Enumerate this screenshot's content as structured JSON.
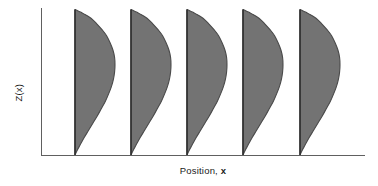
{
  "figure": {
    "title": "",
    "background_color": "#ffffff"
  },
  "axes": {
    "y_label": "Z(x)",
    "x_label_prefix": "Position, ",
    "x_label_variable": "x",
    "x_label_full": "Position, x",
    "axis_color": "#606060",
    "show_ticks": false,
    "show_tick_labels": false,
    "show_grid": false
  },
  "chart_data": {
    "type": "area",
    "title": "",
    "xlabel": "Position, x",
    "ylabel": "Z(x)",
    "orientation": "horizontal-amplitude",
    "legend": "none",
    "grid": false,
    "xlim": [
      0,
      1
    ],
    "ylim": [
      0,
      1
    ],
    "series_count": 5,
    "baseline_positions_px": [
      75,
      131,
      187,
      243,
      300
    ],
    "baseline_positions_normalized": [
      0.105,
      0.278,
      0.451,
      0.623,
      0.799
    ],
    "peak_amplitude_px": 40,
    "peak_height_normalized": 0.52,
    "curve_profile": {
      "comment": "Amplitude of each distribution sampled from the top of the axis (Z high) down to the baseline (Z low).",
      "z_fraction": [
        1.0,
        0.97,
        0.94,
        0.9,
        0.86,
        0.82,
        0.77,
        0.72,
        0.67,
        0.62,
        0.57,
        0.52,
        0.47,
        0.42,
        0.37,
        0.32,
        0.27,
        0.22,
        0.17,
        0.12,
        0.07,
        0.03,
        0.0
      ],
      "amplitude_fraction": [
        0.0,
        0.22,
        0.4,
        0.55,
        0.68,
        0.79,
        0.88,
        0.95,
        0.99,
        1.0,
        0.99,
        0.96,
        0.91,
        0.84,
        0.76,
        0.66,
        0.56,
        0.45,
        0.34,
        0.23,
        0.13,
        0.05,
        0.0
      ]
    },
    "series": [
      {
        "name": "distribution-1",
        "baseline_x": 0.105,
        "peak_amplitude": 0.52,
        "peak_z": 0.62
      },
      {
        "name": "distribution-2",
        "baseline_x": 0.278,
        "peak_amplitude": 0.52,
        "peak_z": 0.62
      },
      {
        "name": "distribution-3",
        "baseline_x": 0.451,
        "peak_amplitude": 0.52,
        "peak_z": 0.62
      },
      {
        "name": "distribution-4",
        "baseline_x": 0.623,
        "peak_amplitude": 0.52,
        "peak_z": 0.62
      },
      {
        "name": "distribution-5",
        "baseline_x": 0.799,
        "peak_amplitude": 0.52,
        "peak_z": 0.62
      }
    ],
    "colors": {
      "fill": "#737373",
      "stroke": "#4a4a4a",
      "baseline": "#2b2b2b",
      "axis": "#606060"
    }
  }
}
